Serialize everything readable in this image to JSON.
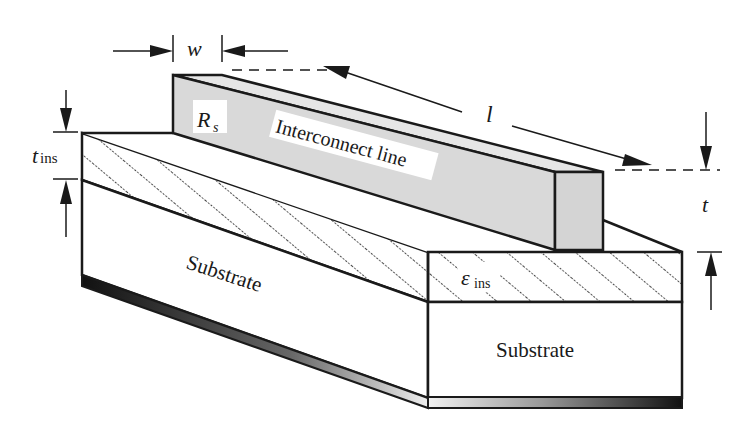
{
  "diagram": {
    "labels": {
      "width": "w",
      "length": "l",
      "thickness": "t",
      "insulator_thickness_main": "t",
      "insulator_thickness_sub": "ins",
      "sheet_resistance_main": "R",
      "sheet_resistance_sub": "s",
      "interconnect": "Interconnect line",
      "permittivity_main": "ε",
      "permittivity_sub": "ins",
      "substrate_side": "Substrate",
      "substrate_front": "Substrate"
    },
    "colors": {
      "line_fill": "#d9d9d9",
      "stroke": "#1a1a1a",
      "background": "#ffffff"
    }
  }
}
